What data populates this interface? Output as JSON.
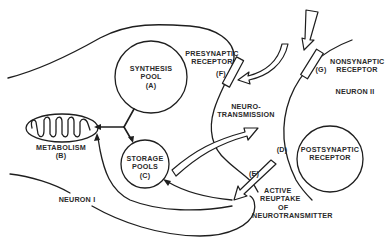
{
  "diagram": {
    "title_visible": false,
    "neurons": [
      {
        "id": "neuron-1",
        "label": "NEURON I"
      },
      {
        "id": "neuron-2",
        "label": "NEURON II"
      }
    ],
    "components": {
      "synthesis_pool": {
        "lines": [
          "SYNTHESIS",
          "POOL",
          "(A)"
        ]
      },
      "metabolism": {
        "lines": [
          "METABOLISM",
          "(B)"
        ]
      },
      "storage_pools": {
        "lines": [
          "STORAGE",
          "POOLS",
          "(C)"
        ]
      },
      "postsynaptic_receptor": {
        "tag": "(D)",
        "lines": [
          "POSTSYNAPTIC",
          "RECEPTOR"
        ]
      },
      "reuptake": {
        "tag": "(E)",
        "lines": [
          "ACTIVE",
          "REUPTAKE",
          "OF",
          "NEUROTRANSMITTER"
        ]
      },
      "presynaptic_receptor": {
        "tag": "(F)",
        "lines": [
          "PRESYNAPTIC",
          "RECEPTOR"
        ]
      },
      "nonsynaptic_receptor": {
        "tag": "(G)",
        "lines": [
          "NONSYNAPTIC",
          "RECEPTOR"
        ]
      },
      "neurotransmission": {
        "lines": [
          "NEURO-",
          "TRANSMISSION"
        ]
      }
    },
    "colors": {
      "ink": "#1e1e1e",
      "background": "#ffffff"
    }
  }
}
